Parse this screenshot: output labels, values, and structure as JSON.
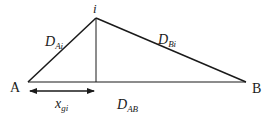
{
  "diagram": {
    "type": "triangle-geometry",
    "points": {
      "A": {
        "label": "A",
        "x": 28,
        "y": 82
      },
      "B": {
        "label": "B",
        "x": 246,
        "y": 82
      },
      "i": {
        "label": "i",
        "x": 96,
        "y": 18
      },
      "foot": {
        "x": 96,
        "y": 82
      }
    },
    "edges": [
      {
        "from": "A",
        "to": "i",
        "label_main": "D",
        "label_sub": "Ai"
      },
      {
        "from": "i",
        "to": "B",
        "label_main": "D",
        "label_sub": "Bi"
      },
      {
        "from": "A",
        "to": "B",
        "label_main": "D",
        "label_sub": "AB"
      },
      {
        "from": "i",
        "to": "foot",
        "label_main": "",
        "label_sub": ""
      }
    ],
    "dimension_arrow": {
      "from_x": 28,
      "to_x": 95,
      "y": 91,
      "label_main": "x",
      "label_sub": "gi"
    },
    "line_color": "#1a1a1a"
  }
}
